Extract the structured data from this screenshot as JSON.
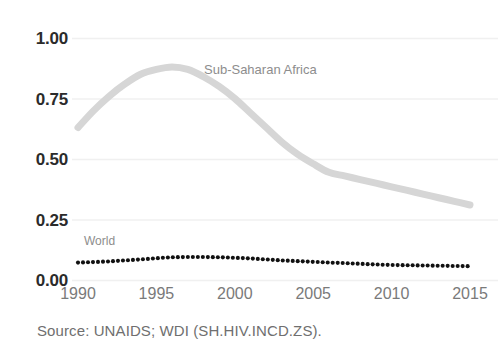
{
  "chart_data": {
    "type": "line",
    "title": "",
    "subtitle": "",
    "xlabel": "",
    "ylabel": "",
    "xlim": [
      1990,
      2015
    ],
    "ylim": [
      0.0,
      1.0
    ],
    "grid": true,
    "grid_axis": "y",
    "legend": "inline-series-labels",
    "y_ticks": [
      "1.00",
      "0.75",
      "0.50",
      "0.25",
      "0.00"
    ],
    "y_tick_values": [
      1.0,
      0.75,
      0.5,
      0.25,
      0.0
    ],
    "x_ticks": [
      "1990",
      "1995",
      "2000",
      "2005",
      "2010",
      "2015"
    ],
    "x_tick_values": [
      1990,
      1995,
      2000,
      2005,
      2010,
      2015
    ],
    "x": [
      1990,
      1991,
      1992,
      1993,
      1994,
      1995,
      1996,
      1997,
      1998,
      1999,
      2000,
      2001,
      2002,
      2003,
      2004,
      2005,
      2006,
      2007,
      2008,
      2009,
      2010,
      2011,
      2012,
      2013,
      2014,
      2015
    ],
    "series": [
      {
        "name": "Sub-Saharan Africa",
        "style": "solid-thick",
        "color": "#d6d6d6",
        "label_x": 2000.5,
        "label_y": 0.89,
        "values": [
          0.63,
          0.7,
          0.76,
          0.81,
          0.85,
          0.87,
          0.88,
          0.87,
          0.84,
          0.8,
          0.75,
          0.69,
          0.63,
          0.57,
          0.52,
          0.48,
          0.445,
          0.43,
          0.415,
          0.4,
          0.385,
          0.37,
          0.355,
          0.34,
          0.325,
          0.31
        ]
      },
      {
        "name": "World",
        "style": "dotted",
        "color": "#111111",
        "label_x": 1990.4,
        "label_y": 0.155,
        "values": [
          0.072,
          0.074,
          0.077,
          0.081,
          0.085,
          0.09,
          0.094,
          0.095,
          0.095,
          0.094,
          0.092,
          0.089,
          0.085,
          0.081,
          0.078,
          0.075,
          0.072,
          0.07,
          0.067,
          0.064,
          0.062,
          0.061,
          0.06,
          0.059,
          0.058,
          0.057
        ]
      }
    ]
  },
  "axis": {
    "y_labels": [
      "1.00",
      "0.75",
      "0.50",
      "0.25",
      "0.00"
    ],
    "x_labels": [
      "1990",
      "1995",
      "2000",
      "2005",
      "2010",
      "2015"
    ]
  },
  "labels": {
    "sub_saharan_africa": "Sub-Saharan Africa",
    "world": "World"
  },
  "caption": {
    "source": "Source: UNAIDS; WDI (SH.HIV.INCD.ZS)."
  },
  "colors": {
    "background": "#ffffff",
    "gridline": "#f0f0f0",
    "ssa_line": "#d6d6d6",
    "world_dots": "#111111",
    "y_tick_text": "#2b2b2b",
    "x_tick_text": "#7a7a7a",
    "series_label_text": "#8d8d8d",
    "caption_text": "#6f6f6f"
  }
}
